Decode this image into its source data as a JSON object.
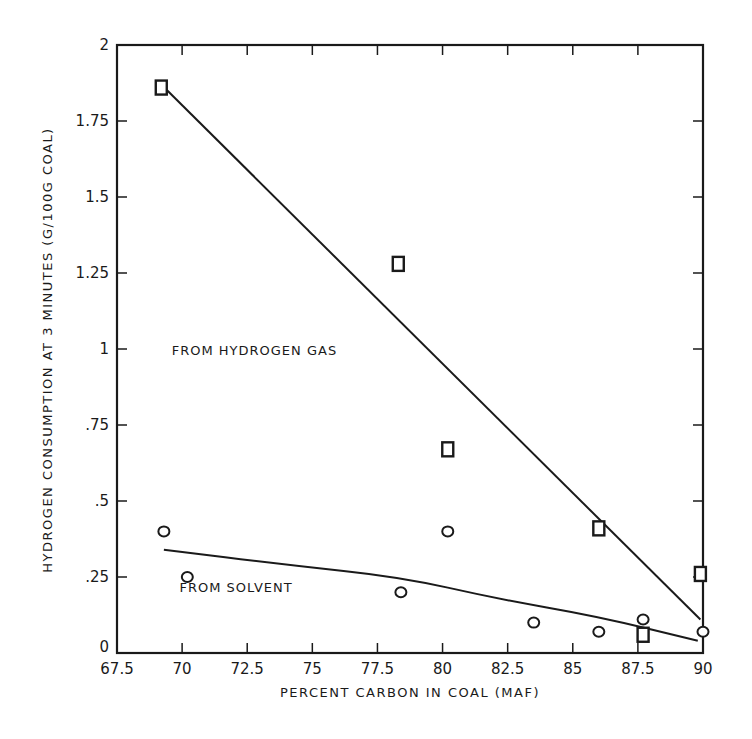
{
  "chart_data": {
    "type": "scatter",
    "title": "",
    "xlabel": "PERCENT CARBON IN COAL (MAF)",
    "ylabel": "HYDROGEN CONSUMPTION AT 3 MINUTES (G/100G COAL)",
    "xlim": [
      67.5,
      90
    ],
    "ylim": [
      0,
      2
    ],
    "x_ticks": [
      "67.5",
      "70",
      "72.5",
      "75",
      "77.5",
      "80",
      "82.5",
      "85",
      "87.5",
      "90"
    ],
    "y_ticks": [
      "0",
      ".25",
      ".5",
      ".75",
      "1",
      "1.25",
      "1.5",
      "1.75",
      "2"
    ],
    "grid": false,
    "legend": "none (inline annotations)",
    "annotations": [
      {
        "text": "FROM HYDROGEN GAS",
        "x": 69.6,
        "y": 0.98
      },
      {
        "text": "FROM SOLVENT",
        "x": 69.9,
        "y": 0.2
      }
    ],
    "series": [
      {
        "name": "From Hydrogen Gas",
        "marker": "square",
        "points": [
          {
            "x": 69.2,
            "y": 1.86
          },
          {
            "x": 78.3,
            "y": 1.28
          },
          {
            "x": 80.2,
            "y": 0.67
          },
          {
            "x": 86.0,
            "y": 0.41
          },
          {
            "x": 87.7,
            "y": 0.06
          },
          {
            "x": 89.9,
            "y": 0.26
          }
        ],
        "fit_line": [
          {
            "x": 69.2,
            "y": 1.87
          },
          {
            "x": 89.9,
            "y": 0.11
          }
        ]
      },
      {
        "name": "From Solvent",
        "marker": "circle",
        "points": [
          {
            "x": 69.3,
            "y": 0.4
          },
          {
            "x": 70.2,
            "y": 0.25
          },
          {
            "x": 78.4,
            "y": 0.2
          },
          {
            "x": 80.2,
            "y": 0.4
          },
          {
            "x": 83.5,
            "y": 0.1
          },
          {
            "x": 86.0,
            "y": 0.07
          },
          {
            "x": 87.7,
            "y": 0.11
          },
          {
            "x": 90.0,
            "y": 0.07
          }
        ],
        "fit_line": [
          {
            "x": 69.3,
            "y": 0.34
          },
          {
            "x": 74.0,
            "y": 0.29
          },
          {
            "x": 78.4,
            "y": 0.25
          },
          {
            "x": 82.0,
            "y": 0.18
          },
          {
            "x": 86.0,
            "y": 0.12
          },
          {
            "x": 89.8,
            "y": 0.04
          }
        ]
      }
    ]
  }
}
